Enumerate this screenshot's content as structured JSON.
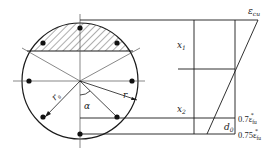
{
  "diagram": {
    "type": "circular-section-strain-diagram",
    "section": {
      "shape": "circle",
      "labels": {
        "radius": "r",
        "rebar_radius": "r",
        "rebar_radius_sub": "s",
        "angle": "α"
      },
      "compression_zone": "hatched segment",
      "rebar_count": 8
    },
    "strain_profile": {
      "top_label": "ε",
      "top_label_sub": "cu",
      "depth_labels": [
        {
          "main": "x",
          "sub": "1"
        },
        {
          "main": "x",
          "sub": "2"
        }
      ],
      "offset_label": {
        "main": "d",
        "sub": "0"
      },
      "bottom_labels": [
        {
          "prefix": "0.7ε",
          "sub": "fu",
          "sup": "*"
        },
        {
          "prefix": "0.75ε",
          "sub": "fu",
          "sup": "*"
        }
      ]
    }
  },
  "colors": {
    "line": "#1a1a1a",
    "background": "#ffffff"
  }
}
